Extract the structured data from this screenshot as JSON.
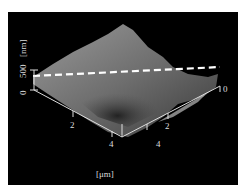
{
  "figure": {
    "type": "AFM 3D surface topography",
    "z_axis": {
      "label": "[nm]",
      "ticks": [
        "0",
        "500"
      ]
    },
    "x_axis": {
      "ticks": [
        "2",
        "4"
      ]
    },
    "y_axis": {
      "ticks": [
        "0",
        "2",
        "4"
      ]
    },
    "lateral_unit_label": "[μm]",
    "profile_line": "dashed white line across surface",
    "colors": {
      "background": "#000000",
      "axis": "#dddddd",
      "profile_line": "#ffffff"
    }
  }
}
